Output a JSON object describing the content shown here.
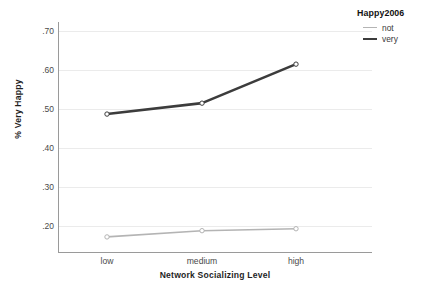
{
  "chart_data": {
    "type": "line",
    "title": "",
    "xlabel": "Network Socializing Level",
    "ylabel": "% Very Happy",
    "categories": [
      "low",
      "medium",
      "high"
    ],
    "ylim": [
      0.155,
      0.735
    ],
    "yticks": [
      ".20",
      ".30",
      ".40",
      ".50",
      ".60",
      ".70"
    ],
    "ytick_values": [
      0.2,
      0.3,
      0.4,
      0.5,
      0.6,
      0.7
    ],
    "grid": true,
    "legend": {
      "title": "Happy2006",
      "position": "top-right",
      "entries": [
        {
          "name": "not",
          "color": "#b4b4b4"
        },
        {
          "name": "very",
          "color": "#3c3c3c"
        }
      ]
    },
    "series": [
      {
        "name": "not",
        "color": "#b4b4b4",
        "width": 1.6,
        "values": [
          0.172,
          0.188,
          0.193
        ]
      },
      {
        "name": "very",
        "color": "#3c3c3c",
        "width": 2.6,
        "values": [
          0.487,
          0.515,
          0.615
        ]
      }
    ]
  },
  "axes": {
    "y_title": "% Very Happy",
    "x_title": "Network Socializing Level",
    "y_ticks": [
      {
        "label": ".70",
        "value": 0.7
      },
      {
        "label": ".60",
        "value": 0.6
      },
      {
        "label": ".50",
        "value": 0.5
      },
      {
        "label": ".40",
        "value": 0.4
      },
      {
        "label": ".30",
        "value": 0.3
      },
      {
        "label": ".20",
        "value": 0.2
      }
    ],
    "x_ticks": [
      {
        "label": "low"
      },
      {
        "label": "medium"
      },
      {
        "label": "high"
      }
    ]
  },
  "legend": {
    "title": "Happy2006",
    "items": [
      {
        "label": "not"
      },
      {
        "label": "very"
      }
    ]
  }
}
